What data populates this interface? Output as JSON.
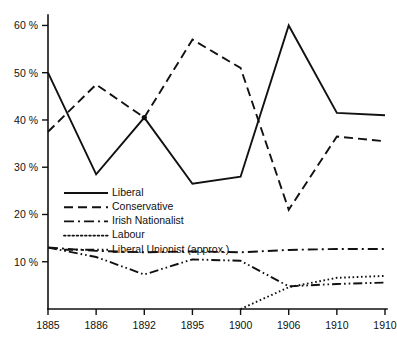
{
  "chart_data": {
    "type": "line",
    "title": "",
    "subtitle": "",
    "xlabel": "",
    "ylabel": "",
    "xlim": [
      0,
      7
    ],
    "ylim": [
      0,
      62
    ],
    "grid": false,
    "legend_position": "inside-lower-left",
    "categories": [
      "1885",
      "1886",
      "1892",
      "1895",
      "1900",
      "1906",
      "1910",
      "1910"
    ],
    "x_tick_labels": [
      "1885",
      "1886",
      "1892",
      "1895",
      "1900",
      "1906",
      "1910",
      "1910"
    ],
    "y_tick_labels": [
      "10 %",
      "20 %",
      "30 %",
      "40 %",
      "50 %",
      "60 %"
    ],
    "y_tick_values": [
      10,
      20,
      30,
      40,
      50,
      60
    ],
    "series": [
      {
        "name": "Liberal",
        "style": "solid",
        "values": [
          50.0,
          28.5,
          40.5,
          26.5,
          28.0,
          60.0,
          41.5,
          41.0
        ]
      },
      {
        "name": "Conservative",
        "style": "dashed",
        "values": [
          37.5,
          47.5,
          40.5,
          57.0,
          51.0,
          21.0,
          36.5,
          35.5
        ]
      },
      {
        "name": "Irish Nationalist",
        "style": "dash-dot",
        "values": [
          13.0,
          12.3,
          12.0,
          12.2,
          12.0,
          12.5,
          12.7,
          12.7
        ]
      },
      {
        "name": "Labour",
        "style": "dotted",
        "values": [
          null,
          null,
          null,
          null,
          0.0,
          4.6,
          6.6,
          7.0
        ]
      },
      {
        "name": "Liberal Unionist (approx.)",
        "style": "dash-dot-dot",
        "values": [
          13.0,
          11.0,
          7.3,
          10.5,
          10.2,
          4.8,
          5.3,
          5.6
        ]
      }
    ],
    "annotations": [
      {
        "label": "crossover-marker",
        "x_index": 2,
        "y": 40.5
      }
    ]
  },
  "legend": {
    "entries": [
      {
        "label": "Liberal",
        "style": "solid"
      },
      {
        "label": "Conservative",
        "style": "dashed"
      },
      {
        "label": "Irish Nationalist",
        "style": "dash-dot"
      },
      {
        "label": "Labour",
        "style": "dotted"
      },
      {
        "label": "Liberal Unionist  (approx.)",
        "style": "dash-dot-dot"
      }
    ]
  },
  "colors": {
    "ink": "#111111",
    "background": "#ffffff"
  }
}
